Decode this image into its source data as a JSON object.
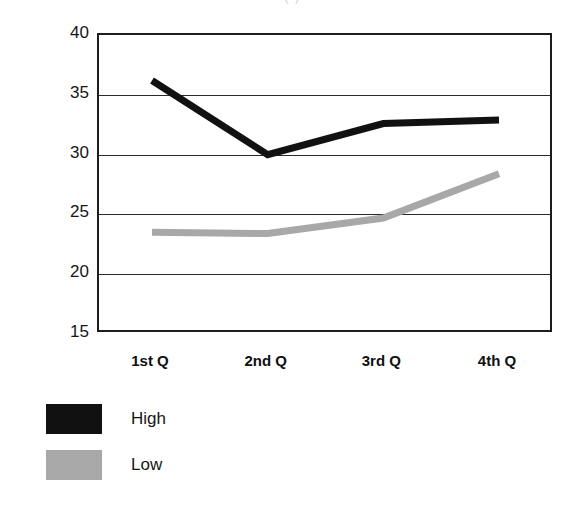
{
  "chart_data": {
    "type": "line",
    "title": "",
    "xlabel": "",
    "ylabel": "",
    "categories": [
      "1st Q",
      "2nd Q",
      "3rd Q",
      "4th Q"
    ],
    "series": [
      {
        "name": "High",
        "color": "#111111",
        "values": [
          36.2,
          30.0,
          32.6,
          32.9
        ]
      },
      {
        "name": "Low",
        "color": "#a8a8a8",
        "values": [
          23.5,
          23.4,
          24.7,
          28.4
        ]
      }
    ],
    "ylim": [
      15,
      40
    ],
    "yticks": [
      40,
      35,
      30,
      25,
      20,
      15
    ],
    "ytick_labels": [
      "40",
      "35",
      "30",
      "25",
      "20",
      "15"
    ],
    "grid": true,
    "grid_axis": "y",
    "legend_position": "below-left"
  },
  "legend": {
    "entries": [
      {
        "label": "High",
        "color": "#111111"
      },
      {
        "label": "Low",
        "color": "#a8a8a8"
      }
    ]
  },
  "artifacts": {
    "top_title_remnant": "(          )",
    "bottom_remnant": ""
  }
}
